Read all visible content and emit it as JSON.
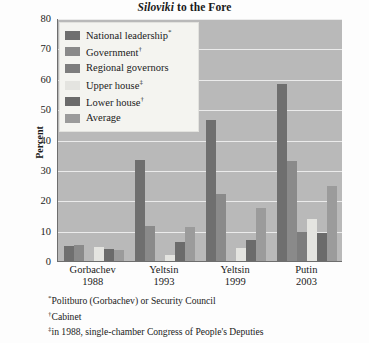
{
  "title": {
    "emphasis": "Siloviki",
    "rest": " to the Fore"
  },
  "axes": {
    "ylabel": "Percent",
    "yticks": [
      "80",
      "70",
      "60",
      "50",
      "40",
      "30",
      "20",
      "10",
      "0"
    ],
    "ymin": 0,
    "ymax": 80
  },
  "legend": {
    "items": [
      {
        "label": "National leadership",
        "marker": "*",
        "color": "#6f6f6f"
      },
      {
        "label": "Government",
        "marker": "†",
        "color": "#8a8a8a"
      },
      {
        "label": "Regional governors",
        "marker": "",
        "color": "#7d7d7d"
      },
      {
        "label": "Upper house",
        "marker": "‡",
        "color": "#e4e4e0"
      },
      {
        "label": "Lower house",
        "marker": "†",
        "color": "#6b6b6b"
      },
      {
        "label": "Average",
        "marker": "",
        "color": "#9b9b9b"
      }
    ]
  },
  "footnotes": [
    {
      "mark": "*",
      "text": "Politburo (Gorbachev) or Security Council"
    },
    {
      "mark": "†",
      "text": "Cabinet"
    },
    {
      "mark": "‡",
      "text": "in 1988, single-chamber Congress of People's Deputies"
    }
  ],
  "chart_data": {
    "type": "bar",
    "title": "Siloviki to the Fore",
    "xlabel": "",
    "ylabel": "Percent",
    "ylim": [
      0,
      80
    ],
    "grid": true,
    "legend_position": "top-left",
    "categories": [
      "Gorbachev 1988",
      "Yeltsin 1993",
      "Yeltsin 1999",
      "Putin 2003"
    ],
    "category_names": [
      "Gorbachev",
      "Yeltsin",
      "Yeltsin",
      "Putin"
    ],
    "category_years": [
      "1988",
      "1993",
      "1999",
      "2003"
    ],
    "series": [
      {
        "name": "National leadership",
        "values": [
          4.8,
          33.3,
          46.5,
          58.3
        ]
      },
      {
        "name": "Government",
        "values": [
          5.4,
          11.4,
          22.0,
          32.8
        ]
      },
      {
        "name": "Regional governors",
        "values": [
          0.0,
          0.0,
          0.0,
          9.6
        ]
      },
      {
        "name": "Upper house",
        "values": [
          4.5,
          2.0,
          4.2,
          13.8
        ]
      },
      {
        "name": "Lower house",
        "values": [
          4.0,
          6.2,
          6.8,
          9.1
        ]
      },
      {
        "name": "Average",
        "values": [
          3.6,
          11.3,
          17.4,
          24.7
        ]
      }
    ]
  }
}
